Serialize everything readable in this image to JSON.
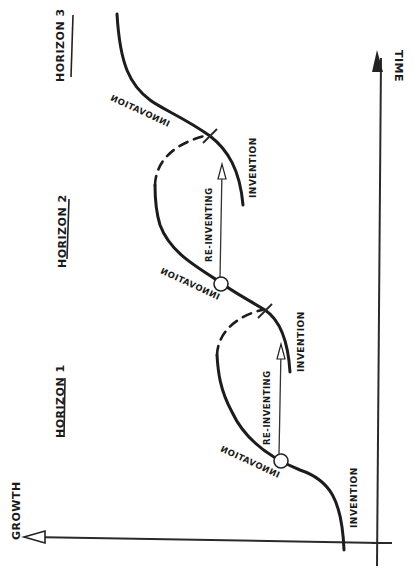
{
  "diagram": {
    "type": "three-horizons-s-curves",
    "orientation": "rotated-90-ccw",
    "colors": {
      "ink": "#1c1c1c",
      "background": "#ffffff"
    },
    "axes": {
      "growth_label": "Growth",
      "time_label": "Time"
    },
    "horizons": [
      {
        "label": "Horizon 1"
      },
      {
        "label": "Horizon 2"
      },
      {
        "label": "Horizon 3"
      }
    ],
    "curve_labels": {
      "h1_invention": "Invention",
      "h1_innovation": "Innovation",
      "h1_reinventing": "Re-inventing",
      "h2_invention": "Invention",
      "h2_innovation": "Innovation",
      "h2_reinventing": "Re-inventing",
      "h3_invention": "Invention",
      "h3_innovation": "Innovation"
    }
  }
}
